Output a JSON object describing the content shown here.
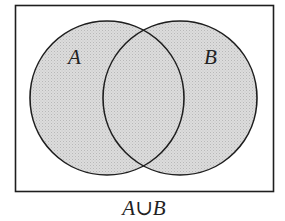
{
  "diagram": {
    "type": "venn",
    "universe": {
      "x": 15,
      "y": 5,
      "width": 258,
      "height": 186
    },
    "sets": [
      {
        "name": "A",
        "label": "A",
        "cx": 107,
        "cy": 98,
        "r": 77,
        "label_x": 76,
        "label_y": 65
      },
      {
        "name": "B",
        "label": "B",
        "cx": 180,
        "cy": 98,
        "r": 77,
        "label_x": 212,
        "label_y": 65
      }
    ],
    "shaded_region": "A∪B",
    "caption": {
      "A": "A",
      "op": "∪",
      "B": "B"
    },
    "colors": {
      "fill": "#d6d6d6",
      "stroke": "#1e1e1e",
      "background": "#ffffff"
    }
  }
}
